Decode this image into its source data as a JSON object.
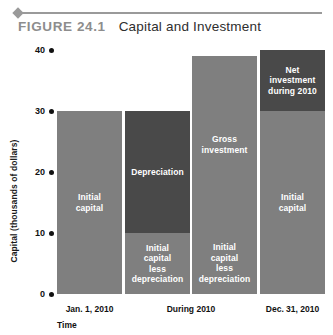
{
  "figure": {
    "number_label": "FIGURE 24.1",
    "title": "Capital and Investment"
  },
  "colors": {
    "light_gray": "#7f7f7f",
    "dark_gray": "#494949",
    "rule": "#9a9a9a",
    "text": "#111111",
    "label_text": "#ffffff"
  },
  "chart_data": {
    "type": "bar",
    "title": "Capital and Investment",
    "xlabel": "Time",
    "ylabel": "Capital (thousands of dollars)",
    "ylim": [
      0,
      40
    ],
    "yticks": [
      0,
      10,
      20,
      30,
      40
    ],
    "ytick_labels": [
      "0",
      "10",
      "20",
      "30",
      "40"
    ],
    "grid": false,
    "legend": "none",
    "categories": [
      "Jan. 1, 2010",
      "During 2010",
      "During 2010",
      "Dec. 31, 2010"
    ],
    "xtick_labels": [
      "Jan. 1, 2010",
      "During 2010",
      "Dec. 31, 2010"
    ],
    "bars": [
      {
        "category": "Jan. 1, 2010",
        "total": 30,
        "segments": [
          {
            "label": "Initial\ncapital",
            "from": 0,
            "to": 30,
            "value": 30,
            "shade": "light"
          }
        ]
      },
      {
        "category": "During 2010",
        "total": 30,
        "segments": [
          {
            "label": "Initial\ncapital\nless\ndepreciation",
            "from": 0,
            "to": 10,
            "value": 10,
            "shade": "light"
          },
          {
            "label": "Depreciation",
            "from": 10,
            "to": 30,
            "value": 20,
            "shade": "dark"
          }
        ]
      },
      {
        "category": "During 2010",
        "total": 39,
        "segments": [
          {
            "label": "Initial\ncapital\nless\ndepreciation",
            "from": 0,
            "to": 10,
            "value": 10,
            "shade": "light"
          },
          {
            "label": "Gross\ninvestment",
            "from": 10,
            "to": 39,
            "value": 29,
            "shade": "light"
          }
        ]
      },
      {
        "category": "Dec. 31, 2010",
        "total": 40,
        "segments": [
          {
            "label": "Initial\ncapital",
            "from": 0,
            "to": 30,
            "value": 30,
            "shade": "light"
          },
          {
            "label": "Net\ninvestment\nduring 2010",
            "from": 30,
            "to": 40,
            "value": 10,
            "shade": "dark"
          }
        ]
      }
    ]
  }
}
